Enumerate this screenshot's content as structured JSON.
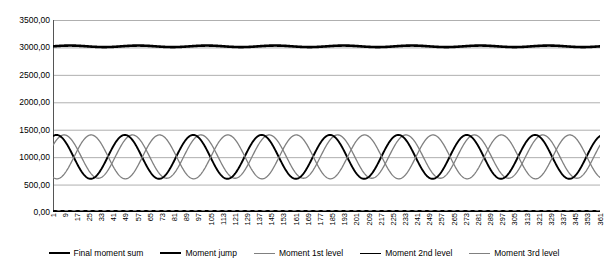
{
  "chart_data": {
    "type": "line",
    "title": "",
    "xlabel": "",
    "ylabel": "",
    "ylim": [
      0,
      3500
    ],
    "ytick_step": 500,
    "ytick_labels": [
      "0,00",
      "500,00",
      "1000,00",
      "1500,00",
      "2000,00",
      "2500,00",
      "3000,00",
      "3500,00"
    ],
    "ytick_values": [
      0,
      500,
      1000,
      1500,
      2000,
      2500,
      3000,
      3500
    ],
    "grid": true,
    "legend_position": "bottom",
    "x_start": 1,
    "x_end": 361,
    "xtick_step": 8,
    "xtick_labels": [
      "1",
      "9",
      "17",
      "25",
      "33",
      "41",
      "49",
      "57",
      "65",
      "73",
      "81",
      "89",
      "97",
      "105",
      "113",
      "121",
      "129",
      "137",
      "145",
      "153",
      "161",
      "169",
      "177",
      "185",
      "193",
      "201",
      "209",
      "217",
      "225",
      "233",
      "241",
      "249",
      "257",
      "265",
      "273",
      "281",
      "289",
      "297",
      "305",
      "313",
      "321",
      "329",
      "337",
      "345",
      "353",
      "361"
    ],
    "series": [
      {
        "name": "Final moment sum",
        "color": "#000000",
        "width": 2.6,
        "kind": "constant",
        "level": 3020,
        "ripple": 14,
        "period": 45,
        "phase": 0
      },
      {
        "name": "Moment jump",
        "color": "#000000",
        "width": 2.6,
        "kind": "constant",
        "level": 8,
        "ripple": 6,
        "period": 5,
        "phase": 0
      },
      {
        "name": "Moment 1st level",
        "color": "#808080",
        "width": 1.3,
        "kind": "sine",
        "mean": 1010,
        "amplitude": 395,
        "period": 45,
        "phase": 0.55
      },
      {
        "name": "Moment 2nd level",
        "color": "#000000",
        "width": 1.9,
        "kind": "sine",
        "mean": 1005,
        "amplitude": 400,
        "period": 45,
        "phase": 1.25
      },
      {
        "name": "Moment 3rd level",
        "color": "#808080",
        "width": 1.3,
        "kind": "sine",
        "mean": 1005,
        "amplitude": 400,
        "period": 45,
        "phase": 4.35
      }
    ]
  },
  "legend": {
    "entries": [
      {
        "label": "Final moment sum"
      },
      {
        "label": "Moment jump"
      },
      {
        "label": "Moment 1st level"
      },
      {
        "label": "Moment 2nd level"
      },
      {
        "label": "Moment 3rd level"
      }
    ]
  }
}
